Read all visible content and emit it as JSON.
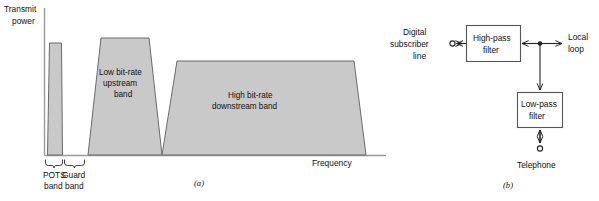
{
  "figure": {
    "panel_a": {
      "caption": "(a)",
      "y_axis_label_line1": "Transmit",
      "y_axis_label_line2": "power",
      "x_axis_label": "Frequency",
      "bands": [
        {
          "id": "pots",
          "label_line1": "POTS",
          "label_line2": "band",
          "inline_label": "",
          "brace_label": "POTS band"
        },
        {
          "id": "guard",
          "label_line1": "Guard",
          "label_line2": "band",
          "inline_label": "",
          "brace_label": "Guard band"
        },
        {
          "id": "upstream",
          "inline_label_line1": "Low bit-rate",
          "inline_label_line2": "upstream",
          "inline_label_line3": "band"
        },
        {
          "id": "downstream",
          "inline_label_line1": "High bit-rate",
          "inline_label_line2": "downstream band"
        }
      ]
    },
    "panel_b": {
      "caption": "(b)",
      "nodes": [
        {
          "id": "dsl",
          "label_line1": "Digital",
          "label_line2": "subscriber",
          "label_line3": "line"
        },
        {
          "id": "high-pass-filter",
          "label_line1": "High-pass",
          "label_line2": "filter"
        },
        {
          "id": "local-loop",
          "label_line1": "Local",
          "label_line2": "loop"
        },
        {
          "id": "low-pass-filter",
          "label_line1": "Low-pass",
          "label_line2": "filter"
        },
        {
          "id": "telephone",
          "label_line1": "Telephone"
        }
      ]
    }
  },
  "colors": {
    "band_fill": "#c9c9c9",
    "band_stroke": "#6b6b6b",
    "axis": "#9a9a9a",
    "wire": "#222222",
    "text": "#111111",
    "background": "#ffffff"
  }
}
